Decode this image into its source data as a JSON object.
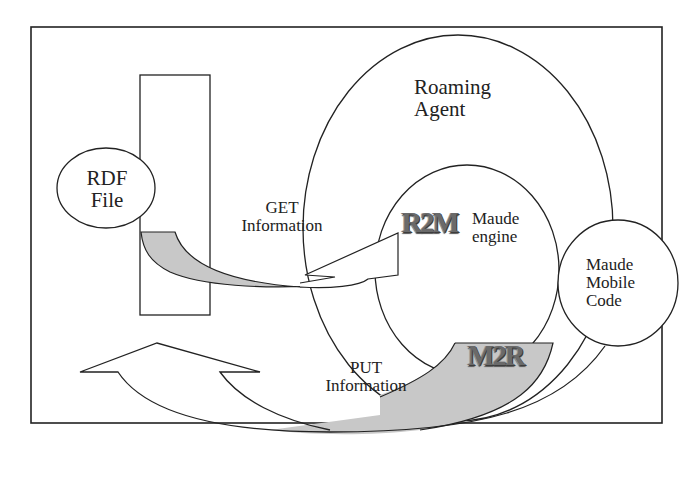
{
  "diagram": {
    "type": "architecture-diagram",
    "colors": {
      "stroke": "#222222",
      "fill_gray": "#c8c8c8",
      "background": "#ffffff",
      "stamp_text": "#6a6a6a"
    },
    "nodes": {
      "roaming_agent": {
        "line1": "Roaming",
        "line2": "Agent"
      },
      "rdf_file": {
        "line1": "RDF",
        "line2": "File"
      },
      "maude_engine": {
        "line1": "Maude",
        "line2": "engine"
      },
      "maude_mobile_code": {
        "line1": "Maude",
        "line2": "Mobile",
        "line3": "Code"
      }
    },
    "arrows": {
      "get": {
        "line1": "GET",
        "line2": "Information"
      },
      "put": {
        "line1": "PUT",
        "line2": "Information"
      }
    },
    "converters": {
      "r2m": "R2M",
      "m2r": "M2R"
    }
  }
}
